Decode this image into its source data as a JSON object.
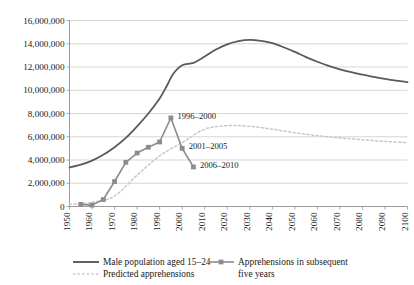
{
  "chart_data": {
    "type": "line",
    "title": "",
    "subtitle": "",
    "xlabel": "",
    "ylabel": "",
    "xlim": [
      1950,
      2100
    ],
    "ylim": [
      0,
      16000000
    ],
    "grid": true,
    "grid_axis": "y",
    "legend_position": "bottom",
    "x_ticks": [
      "1950",
      "1960",
      "1970",
      "1980",
      "1990",
      "2000",
      "2010",
      "2020",
      "2030",
      "2040",
      "2050",
      "2060",
      "2070",
      "2080",
      "2090",
      "2100"
    ],
    "y_ticks": [
      "0",
      "2,000,000",
      "4,000,000",
      "6,000,000",
      "8,000,000",
      "10,000,000",
      "12,000,000",
      "14,000,000",
      "16,000,000"
    ],
    "series": [
      {
        "name": "Male population aged 15–24",
        "style": "solid",
        "color": "#5a5a5a",
        "marker": "none",
        "x": [
          1950,
          1955,
          1960,
          1965,
          1970,
          1975,
          1980,
          1985,
          1990,
          1993,
          1996,
          2000,
          2005,
          2010,
          2015,
          2020,
          2025,
          2030,
          2035,
          2040,
          2045,
          2050,
          2055,
          2060,
          2065,
          2070,
          2075,
          2080,
          2085,
          2090,
          2095,
          2100
        ],
        "values": [
          3350000,
          3600000,
          3950000,
          4450000,
          5100000,
          5900000,
          6900000,
          8000000,
          9300000,
          10300000,
          11400000,
          12150000,
          12350000,
          12900000,
          13500000,
          13950000,
          14220000,
          14330000,
          14250000,
          14050000,
          13700000,
          13300000,
          12850000,
          12450000,
          12100000,
          11800000,
          11550000,
          11350000,
          11150000,
          10980000,
          10830000,
          10700000
        ]
      },
      {
        "name": "Apprehensions in subsequent five years",
        "style": "solid",
        "color": "#8c8c8c",
        "marker": "square",
        "x": [
          1955,
          1960,
          1965,
          1970,
          1975,
          1980,
          1985,
          1990,
          1995,
          2000,
          2005
        ],
        "values": [
          180000,
          120000,
          600000,
          2150000,
          3800000,
          4600000,
          5100000,
          5550000,
          7620000,
          5000000,
          3400000
        ]
      },
      {
        "name": "Predicted apprehensions",
        "style": "dotted",
        "color": "#c8c8c8",
        "marker": "none",
        "x": [
          1950,
          1960,
          1970,
          1980,
          1990,
          2000,
          2010,
          2020,
          2030,
          2040,
          2050,
          2060,
          2070,
          2080,
          2090,
          2100
        ],
        "values": [
          180000,
          350000,
          900000,
          2700000,
          4350000,
          5500000,
          6650000,
          6950000,
          6900000,
          6650000,
          6350000,
          6100000,
          5900000,
          5750000,
          5600000,
          5500000
        ]
      }
    ],
    "annotations": [
      {
        "text": "1996–2000",
        "x": 1995,
        "y": 7620000
      },
      {
        "text": "2001–2005",
        "x": 2000,
        "y": 5000000
      },
      {
        "text": "2006–2010",
        "x": 2005,
        "y": 3400000
      }
    ],
    "legend": [
      {
        "label": "Male population aged 15–24",
        "style": "solid",
        "marker": "none",
        "color": "#5a5a5a"
      },
      {
        "label": "Predicted apprehensions",
        "style": "dotted",
        "marker": "none",
        "color": "#c8c8c8"
      },
      {
        "label": "Apprehensions in subsequent",
        "label2": "five years",
        "style": "solid",
        "marker": "square",
        "color": "#8c8c8c"
      }
    ]
  }
}
